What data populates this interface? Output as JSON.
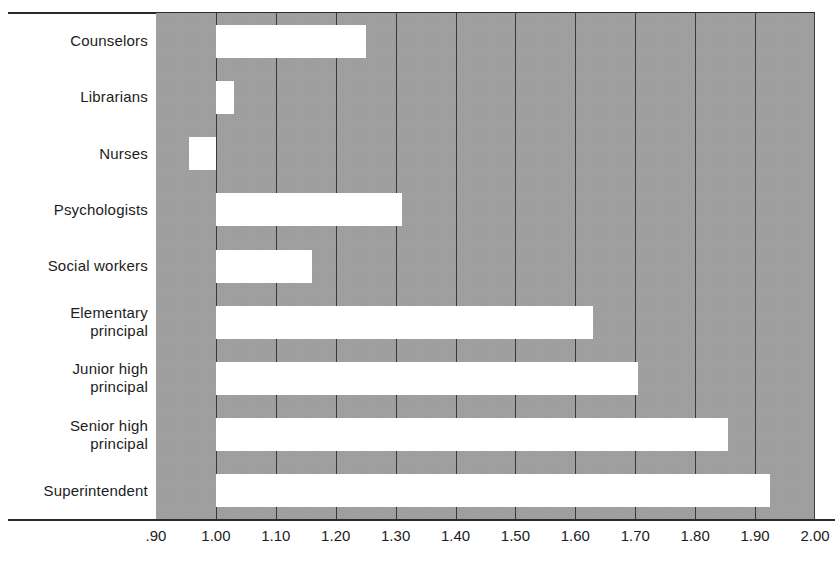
{
  "chart_data": {
    "type": "bar",
    "orientation": "horizontal",
    "title": "",
    "subtitle": "",
    "xlabel": "",
    "ylabel": "",
    "xlim": [
      0.9,
      2.0
    ],
    "baseline": 1.0,
    "grid": true,
    "gridlines_at": [
      1.0,
      1.1,
      1.2,
      1.3,
      1.4,
      1.5,
      1.6,
      1.7,
      1.8,
      1.9
    ],
    "legend": null,
    "legend_position": "none",
    "xtick_labels": [
      ".90",
      "1.00",
      "1.10",
      "1.20",
      "1.30",
      "1.40",
      "1.50",
      "1.60",
      "1.70",
      "1.80",
      "1.90",
      "2.00"
    ],
    "xtick_values": [
      0.9,
      1.0,
      1.1,
      1.2,
      1.3,
      1.4,
      1.5,
      1.6,
      1.7,
      1.8,
      1.9,
      2.0
    ],
    "categories": [
      "Counselors",
      "Librarians",
      "Nurses",
      "Psychologists",
      "Social workers",
      "Elementary principal",
      "Junior high principal",
      "Senior high principal",
      "Superintendent"
    ],
    "values": [
      1.25,
      1.03,
      0.955,
      1.31,
      1.16,
      1.63,
      1.705,
      1.855,
      1.925
    ],
    "bars": [
      {
        "label_line1": "Counselors",
        "label_line2": "",
        "value": 1.25,
        "start": 1.0,
        "end": 1.25
      },
      {
        "label_line1": "Librarians",
        "label_line2": "",
        "value": 1.03,
        "start": 1.0,
        "end": 1.03
      },
      {
        "label_line1": "Nurses",
        "label_line2": "",
        "value": 0.955,
        "start": 0.955,
        "end": 1.0
      },
      {
        "label_line1": "Psychologists",
        "label_line2": "",
        "value": 1.31,
        "start": 1.0,
        "end": 1.31
      },
      {
        "label_line1": "Social workers",
        "label_line2": "",
        "value": 1.16,
        "start": 1.0,
        "end": 1.16
      },
      {
        "label_line1": "Elementary",
        "label_line2": "principal",
        "value": 1.63,
        "start": 1.0,
        "end": 1.63
      },
      {
        "label_line1": "Junior high",
        "label_line2": "principal",
        "value": 1.705,
        "start": 1.0,
        "end": 1.705
      },
      {
        "label_line1": "Senior high",
        "label_line2": "principal",
        "value": 1.855,
        "start": 1.0,
        "end": 1.855
      },
      {
        "label_line1": "Superintendent",
        "label_line2": "",
        "value": 1.925,
        "start": 1.0,
        "end": 1.925
      }
    ],
    "colors": {
      "bar_fill": "#ffffff",
      "plot_background": "#9a9a9a",
      "gridline": "#3a3a3a",
      "axis_line": "#2b2b2b",
      "text": "#1c1c1c",
      "page_background": "#ffffff"
    }
  }
}
